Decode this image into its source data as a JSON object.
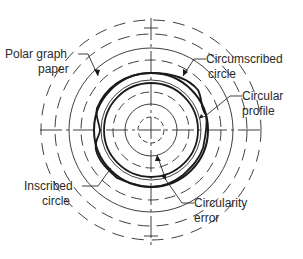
{
  "diagram": {
    "labels": {
      "polar_graph_paper": [
        "Polar graph",
        "paper"
      ],
      "circumscribed_circle": [
        "Circumscribed",
        "circle"
      ],
      "circular_profile": [
        "Circular",
        "profile"
      ],
      "inscribed_circle": [
        "Inscribed",
        "circle"
      ],
      "circularity_error": [
        "Circularity",
        "error"
      ]
    },
    "colors": {
      "line": "#2a2a2a",
      "background": "#ffffff"
    }
  }
}
